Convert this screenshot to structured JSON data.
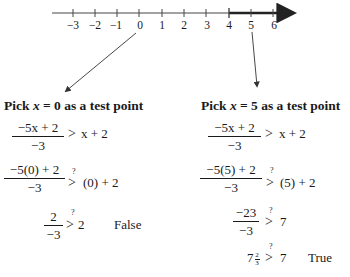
{
  "number_line": {
    "ticks": [
      "−3",
      "−2",
      "−1",
      "0",
      "1",
      "2",
      "3",
      "4",
      "5",
      "6"
    ],
    "highlight_from": "4",
    "highlight_direction": "right",
    "colors": {
      "axis": "#333333",
      "highlight": "#222222"
    }
  },
  "left": {
    "heading_pre": "Pick ",
    "heading_var": "x",
    "heading_post": " = 0 as a test point",
    "step1": {
      "num": "−5x + 2",
      "den": "−3",
      "rel": ">",
      "rhs": "x + 2"
    },
    "step2": {
      "num": "−5(0) + 2",
      "den": "−3",
      "q": "?",
      "rel": ">",
      "rhs": "(0) + 2"
    },
    "step3": {
      "num": "2",
      "den": "−3",
      "q": "?",
      "rel": ">",
      "rhs": "2"
    },
    "verdict": "False"
  },
  "right": {
    "heading_pre": "Pick ",
    "heading_var": "x",
    "heading_post": " = 5 as a test point",
    "step1": {
      "num": "−5x + 2",
      "den": "−3",
      "rel": ">",
      "rhs": "x + 2"
    },
    "step2": {
      "num": "−5(5) + 2",
      "den": "−3",
      "q": "?",
      "rel": ">",
      "rhs": "(5) + 2"
    },
    "step3": {
      "num": "−23",
      "den": "−3",
      "q": "?",
      "rel": ">",
      "rhs": "7"
    },
    "step4": {
      "whole": "7",
      "frac_num": "2",
      "frac_den": "3",
      "q": "?",
      "rel": ">",
      "rhs": "7"
    },
    "verdict": "True"
  }
}
